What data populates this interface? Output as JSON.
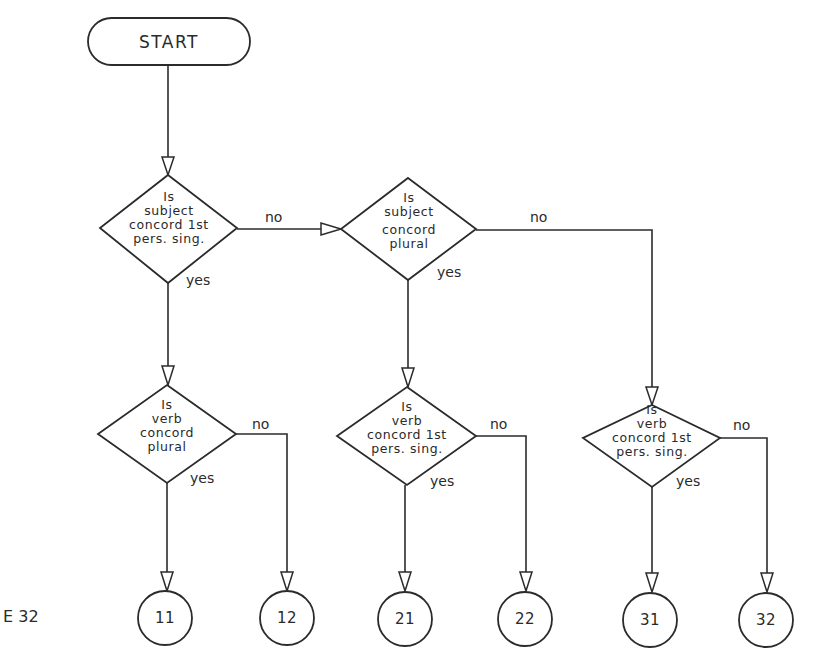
{
  "figure_label": "E 32",
  "start": {
    "label": "START"
  },
  "decisions": [
    {
      "id": "d1",
      "lines": [
        "Is",
        "subject",
        "concord 1st",
        "pers. sing."
      ]
    },
    {
      "id": "d2",
      "lines": [
        "Is",
        "subject",
        "concord",
        "plural"
      ]
    },
    {
      "id": "d3",
      "lines": [
        "Is",
        "verb",
        "concord",
        "plural"
      ]
    },
    {
      "id": "d4",
      "lines": [
        "Is",
        "verb",
        "concord 1st",
        "pers. sing."
      ]
    },
    {
      "id": "d5",
      "lines": [
        "Is",
        "verb",
        "concord 1st",
        "pers. sing."
      ]
    }
  ],
  "edges": {
    "d1_no": "no",
    "d1_yes": "yes",
    "d2_no": "no",
    "d2_yes": "yes",
    "d3_no": "no",
    "d3_yes": "yes",
    "d4_no": "no",
    "d4_yes": "yes",
    "d5_no": "no",
    "d5_yes": "yes"
  },
  "terminals": [
    "11",
    "12",
    "21",
    "22",
    "31",
    "32"
  ],
  "colors": {
    "line": "#2b2b2b",
    "background": "#ffffff"
  }
}
